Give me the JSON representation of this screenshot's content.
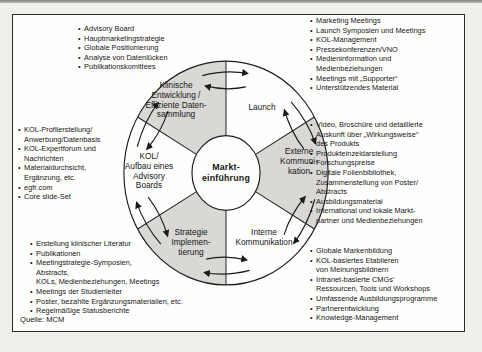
{
  "colors": {
    "page_background": "#f0efec",
    "panel_background": "#fefefd",
    "segment_shaded": "#d9d8d5",
    "outline": "#1c1c1c",
    "text": "#161616"
  },
  "source_note": "Quelle: MCM",
  "wheel": {
    "center_label": "Markt-\neinführung",
    "segments": [
      {
        "id": "klinische-entwicklung",
        "label": "Klinische\nEntwicklung /\nEffiziente Daten-\nsammlung",
        "shaded": true
      },
      {
        "id": "launch",
        "label": "Launch",
        "shaded": false
      },
      {
        "id": "externe-kommunikation",
        "label": "Externe\nKommuni-\nkation",
        "shaded": true
      },
      {
        "id": "interne-kommunikation",
        "label": "Interne\nKommunikation",
        "shaded": false
      },
      {
        "id": "strategie-implementierung",
        "label": "Strategie\nImplemen-\ntierung",
        "shaded": true
      },
      {
        "id": "kol-advisory-boards",
        "label": "KOL/\nAufbau eines\nAdvisory\nBoards",
        "shaded": false
      }
    ]
  },
  "lists": {
    "top_left": {
      "items": [
        "Advisory Board",
        "Hauptmarketingstrategie",
        "Globale Positionierung",
        "Analyse von Datenlücken",
        "Publikationskomittees"
      ]
    },
    "top_right": {
      "items": [
        "Marketing Meetings",
        "Launch Symposien und Meetings",
        "KOL-Management",
        "Pressekonferenzen/VNO",
        "Medieninformation und\nMedienbeziehungen",
        "Meetings mit „Supporter“",
        "Unterstützendes Material"
      ]
    },
    "left": {
      "items": [
        "KOL-Profilerstellung/\nAnwerbung/Datenbasis",
        "KOL-Expertforum und\nNachrichten",
        "Materialdurchsicht,\nErgänzung, etc.",
        "egfr.com",
        "Core slide-Set"
      ]
    },
    "right": {
      "items": [
        "Video, Broschüre und detaillierte\nAuskunft über „Wirkungsweise“\ndes Produkts",
        "Produkteinzeldarstellung",
        "Forschungspreise",
        "Digitale Folienbibliothek,\nZusammenstellung von Poster/\nAbstracts",
        "Ausbildungsmaterial",
        "International und lokale Markt-\npartner und Medienbeziehungen"
      ]
    },
    "bottom_right": {
      "items": [
        "Globale Markenbildung",
        "KOL-basiertes Etablieren\nvon Meinungsbildnern",
        "Intranet-basierte CMGs'\nRessourcen, Tools und Workshops",
        "Umfassende Ausbildungsprogramme",
        "Partnerentwicklung",
        "Knowledge-Management"
      ]
    },
    "bottom_left": {
      "items": [
        "Erstellung klinischer Literatur",
        "Publikationen",
        "Meetingstrategie-Symposien,\nAbstracts,\nKOLs, Medienbeziehungen, Meetings",
        "Meetings der Studienleiter",
        "Poster, bezahlte Ergänzungsmaterialien, etc.",
        "Regelmäßige Statusberichte"
      ]
    }
  }
}
